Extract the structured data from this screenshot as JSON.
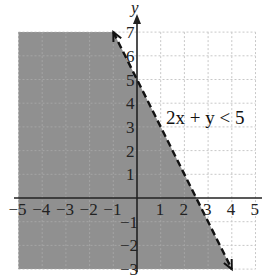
{
  "chart_data": {
    "type": "line",
    "title": "",
    "xlabel": "",
    "ylabel": "y",
    "xlim": [
      -5,
      5
    ],
    "ylim": [
      -3,
      7
    ],
    "grid": true,
    "x_ticks": [
      "−5",
      "−4",
      "−3",
      "−2",
      "−1",
      "1",
      "2",
      "3",
      "4",
      "5"
    ],
    "y_ticks": [
      "7",
      "6",
      "5",
      "4",
      "3",
      "2",
      "1",
      "−1",
      "−2",
      "−3"
    ],
    "boundary_line": {
      "equation": "2x + y = 5",
      "style": "dashed",
      "points": [
        [
          -1,
          7
        ],
        [
          4,
          -3
        ]
      ],
      "arrows_both_ends": true
    },
    "shaded_region": {
      "inequality": "2x + y < 5",
      "side": "below-left of line",
      "color": "#8a8a8a"
    },
    "annotation": "2x + y < 5"
  },
  "labels": {
    "y_axis": "y",
    "inequality": "2x + y < 5"
  }
}
